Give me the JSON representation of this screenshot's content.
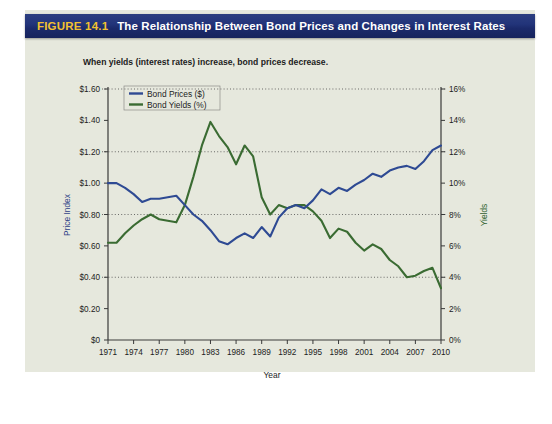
{
  "header": {
    "figure_label": "FIGURE 14.1",
    "title": "The Relationship Between Bond Prices and Changes in Interest Rates",
    "label_color": "#f2c230",
    "bar_color": "#22347a"
  },
  "chart_data": {
    "type": "line",
    "title": "The Relationship Between Bond Prices and Changes in Interest Rates",
    "subtitle": "When yields (interest rates) increase, bond prices decrease.",
    "xlabel": "Year",
    "ylabel": "Price Index",
    "y2label": "Yields",
    "grid": true,
    "legend_position": "top-left",
    "x": [
      1971,
      1972,
      1973,
      1974,
      1975,
      1976,
      1977,
      1978,
      1979,
      1980,
      1981,
      1982,
      1983,
      1984,
      1985,
      1986,
      1987,
      1988,
      1989,
      1990,
      1991,
      1992,
      1993,
      1994,
      1995,
      1996,
      1997,
      1998,
      1999,
      2000,
      2001,
      2002,
      2003,
      2004,
      2005,
      2006,
      2007,
      2008,
      2009,
      2010
    ],
    "xlim": [
      1971,
      2010
    ],
    "ylim": [
      0,
      1.6
    ],
    "y2lim": [
      0,
      16
    ],
    "xticks": [
      "1971",
      "1974",
      "1977",
      "1980",
      "1983",
      "1986",
      "1989",
      "1992",
      "1995",
      "1998",
      "2001",
      "2004",
      "2007",
      "2010"
    ],
    "yticks": [
      "$0",
      "$0.20",
      "$0.40",
      "$0.60",
      "$0.80",
      "$1.00",
      "$1.20",
      "$1.40",
      "$1.60"
    ],
    "y2ticks": [
      "0%",
      "2%",
      "4%",
      "6%",
      "8%",
      "10%",
      "12%",
      "14%",
      "16%"
    ],
    "gridlines": [
      0.4,
      0.8,
      1.2,
      1.6
    ],
    "series": [
      {
        "name": "Bond Prices ($)",
        "label": "Bond Prices ($)",
        "color": "#2e4a93",
        "axis": "left",
        "units": "$",
        "values": [
          1.0,
          1.0,
          0.97,
          0.93,
          0.88,
          0.9,
          0.9,
          0.91,
          0.92,
          0.86,
          0.8,
          0.76,
          0.7,
          0.63,
          0.61,
          0.65,
          0.68,
          0.65,
          0.72,
          0.66,
          0.78,
          0.84,
          0.86,
          0.84,
          0.89,
          0.96,
          0.93,
          0.97,
          0.95,
          0.99,
          1.02,
          1.06,
          1.04,
          1.08,
          1.1,
          1.11,
          1.09,
          1.14,
          1.21,
          1.24
        ]
      },
      {
        "name": "Bond Yields (%)",
        "label": "Bond Yields (%)",
        "color": "#3a6b32",
        "axis": "right",
        "units": "%",
        "values": [
          6.2,
          6.2,
          6.8,
          7.3,
          7.7,
          8.0,
          7.7,
          7.6,
          7.5,
          8.6,
          10.4,
          12.4,
          13.9,
          13.0,
          12.3,
          11.2,
          12.4,
          11.7,
          9.1,
          8.0,
          8.6,
          8.4,
          8.6,
          8.6,
          8.2,
          7.6,
          6.5,
          7.1,
          6.9,
          6.2,
          5.7,
          6.1,
          5.8,
          5.1,
          4.7,
          4.0,
          4.1,
          4.4,
          4.6,
          3.3
        ]
      }
    ]
  }
}
